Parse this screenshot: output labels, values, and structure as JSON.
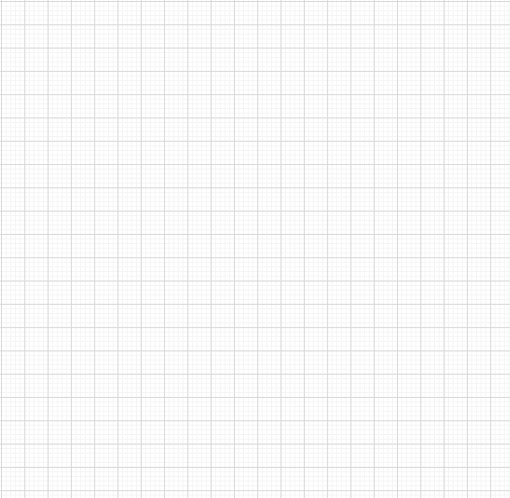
{
  "canvas": {
    "name": "blank-grid-canvas",
    "width": 510,
    "height": 498,
    "background_color": "#ffffff",
    "content": "",
    "description": "Empty grid / graph-paper canvas with no drawn content"
  },
  "grid": {
    "visible": true,
    "cell_size_px": 23.3,
    "columns": 22,
    "rows": 22,
    "line_color": "#d9d9d9",
    "line_width_px": 1,
    "texture_color": "#ececec",
    "origin_offset_px": 1
  }
}
